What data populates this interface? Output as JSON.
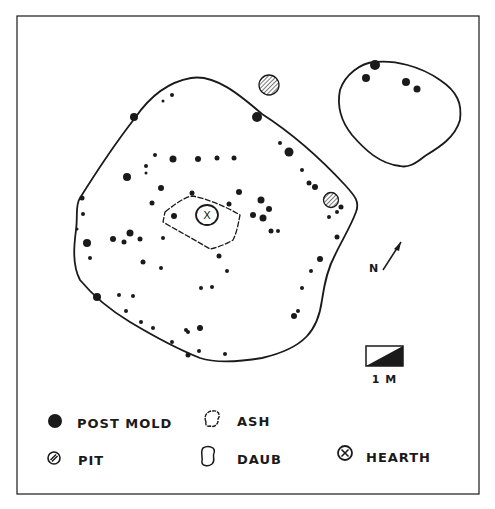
{
  "colors": {
    "ink": "#1a1a1a",
    "paper": "#ffffff"
  },
  "frame": {
    "x": 17,
    "y": 16,
    "w": 462,
    "h": 478
  },
  "main_structure": {
    "outline": "M 191 78 C 215 74 240 95 262 114 C 290 132 320 158 345 185 C 355 196 360 202 356 212 C 350 228 342 240 335 255 C 328 268 325 280 322 300 C 318 330 305 348 262 358 C 238 362 215 363 200 358 C 180 350 160 340 130 322 C 110 310 95 298 80 280 C 72 265 74 245 76 230 C 78 215 75 205 80 198 C 90 182 110 150 135 118 C 150 96 168 82 191 78 Z",
    "ash_outline": "M 165 212 C 175 204 185 197 192 196 C 205 198 225 206 240 215 C 238 225 237 232 233 240 C 225 245 215 248 210 249 C 195 240 180 232 163 222 Z",
    "post_molds": [
      [
        134,
        117,
        4
      ],
      [
        257,
        117,
        5
      ],
      [
        289,
        152,
        4.5
      ],
      [
        173,
        159,
        3.5
      ],
      [
        198,
        159,
        3
      ],
      [
        217,
        158,
        2.5
      ],
      [
        234,
        158,
        2.5
      ],
      [
        155,
        155,
        2
      ],
      [
        127,
        177,
        4
      ],
      [
        146,
        166,
        2
      ],
      [
        146,
        173,
        1.5
      ],
      [
        161,
        188,
        3
      ],
      [
        192,
        193,
        2.5
      ],
      [
        239,
        192,
        3
      ],
      [
        261,
        200,
        3.5
      ],
      [
        229,
        204,
        2.5
      ],
      [
        269,
        209,
        3
      ],
      [
        152,
        203,
        2.5
      ],
      [
        174,
        216,
        3
      ],
      [
        253,
        215,
        3
      ],
      [
        263,
        218,
        3.5
      ],
      [
        130,
        233,
        3.5
      ],
      [
        113,
        239,
        3
      ],
      [
        124,
        242,
        2.5
      ],
      [
        140,
        239,
        2.5
      ],
      [
        87,
        243,
        4
      ],
      [
        163,
        238,
        2
      ],
      [
        90,
        258,
        2
      ],
      [
        143,
        262,
        2.5
      ],
      [
        161,
        268,
        2
      ],
      [
        219,
        256,
        2.5
      ],
      [
        227,
        271,
        2
      ],
      [
        201,
        288,
        2
      ],
      [
        212,
        287,
        2
      ],
      [
        97,
        297,
        4
      ],
      [
        119,
        295,
        2
      ],
      [
        133,
        296,
        2
      ],
      [
        126,
        311,
        2
      ],
      [
        141,
        322,
        2
      ],
      [
        153,
        328,
        2
      ],
      [
        188,
        332,
        2
      ],
      [
        200,
        328,
        3
      ],
      [
        186,
        330,
        2
      ],
      [
        172,
        342,
        2
      ],
      [
        199,
        351,
        2
      ],
      [
        188,
        355,
        2.5
      ],
      [
        225,
        354,
        2
      ],
      [
        294,
        316,
        3
      ],
      [
        298,
        311,
        2
      ],
      [
        302,
        288,
        2
      ],
      [
        311,
        271,
        2
      ],
      [
        320,
        259,
        3
      ],
      [
        337,
        212,
        2
      ],
      [
        341,
        207,
        2.5
      ],
      [
        329,
        217,
        2
      ],
      [
        302,
        170,
        2
      ],
      [
        309,
        183,
        2.5
      ],
      [
        315,
        187,
        3
      ],
      [
        280,
        143,
        2
      ],
      [
        337,
        237,
        2.5
      ],
      [
        271,
        231,
        2.5
      ],
      [
        278,
        231,
        2
      ],
      [
        82,
        198,
        2.5
      ],
      [
        83,
        214,
        2
      ],
      [
        77,
        229,
        1.5
      ],
      [
        172,
        95,
        2
      ],
      [
        163,
        101,
        1.5
      ]
    ],
    "pits": [
      [
        269,
        85,
        10
      ],
      [
        331,
        200,
        7.5
      ]
    ],
    "hearth": {
      "cx": 207,
      "cy": 215,
      "rx": 11,
      "ry": 10,
      "label": "X"
    }
  },
  "secondary_structure": {
    "outline": "M 375 62 C 395 60 420 66 440 80 C 458 92 462 104 460 120 C 455 138 438 148 425 156 C 415 164 408 168 400 166 C 380 164 365 150 352 135 C 340 120 337 105 340 90 C 345 75 360 63 375 62 Z",
    "post_molds": [
      [
        375,
        65,
        5
      ],
      [
        366,
        78,
        4
      ],
      [
        406,
        82,
        4
      ],
      [
        417,
        89,
        3.5
      ]
    ]
  },
  "north_arrow": {
    "label": "N",
    "x1": 383,
    "y1": 270,
    "x2": 401,
    "y2": 242
  },
  "scale_bar": {
    "x": 366,
    "y": 346,
    "w": 37,
    "h": 20,
    "label": "1 M"
  },
  "legend": {
    "items": [
      {
        "key": "post-mold",
        "label": "POST MOLD",
        "sx": 55,
        "sy": 421,
        "tx": 77,
        "ty": 428
      },
      {
        "key": "ash",
        "label": "ASH",
        "sx": 212,
        "sy": 419,
        "tx": 237,
        "ty": 426
      },
      {
        "key": "pit",
        "label": "PIT",
        "sx": 54,
        "sy": 458,
        "tx": 78,
        "ty": 465
      },
      {
        "key": "daub",
        "label": "DAUB",
        "sx": 208,
        "sy": 456,
        "tx": 237,
        "ty": 464
      },
      {
        "key": "hearth",
        "label": "HEARTH",
        "sx": 345,
        "sy": 453,
        "tx": 366,
        "ty": 462
      }
    ]
  }
}
